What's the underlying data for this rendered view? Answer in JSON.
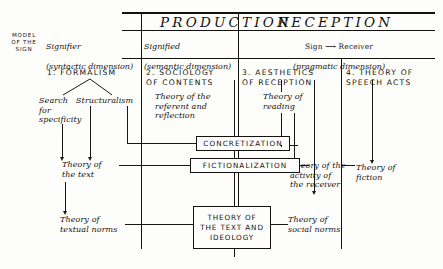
{
  "diagram": {
    "side_label": "MODEL\nOF THE\nSIGN",
    "banners": [
      {
        "id": "production",
        "label": "PRODUCTION"
      },
      {
        "id": "reception",
        "label": "RECEPTION"
      }
    ],
    "dimension_headers": [
      {
        "id": "signifier",
        "title": "Signifier",
        "sub": "(syntactic dimension)"
      },
      {
        "id": "signified",
        "title": "Signified",
        "sub": "(semantic dimension)"
      },
      {
        "id": "sign-receiver",
        "title": "Sign ⟶ Receiver",
        "sub": "(pragmatic dimension)"
      }
    ],
    "columns": [
      {
        "number": "1.",
        "title": "1. FORMALISM"
      },
      {
        "number": "2.",
        "title": "2. SOCIOLOGY\n     OF CONTENTS"
      },
      {
        "number": "3.",
        "title": "3. AESTHETICS\n    OF RECEPTION"
      },
      {
        "number": "4.",
        "title": "4. THEORY OF\n    SPEECH ACTS"
      }
    ],
    "nodes": [
      {
        "id": "search-for-specificity",
        "label": "Search\nfor\nspecificity"
      },
      {
        "id": "structuralism",
        "label": "Structuralism"
      },
      {
        "id": "theory-of-referent-and-reflection",
        "label": "Theory of the\nreferent and\nreflection"
      },
      {
        "id": "theory-of-reading",
        "label": "Theory of\nreading"
      },
      {
        "id": "theory-of-the-text",
        "label": "Theory of\nthe text"
      },
      {
        "id": "theory-of-activity-of-receiver",
        "label": "Theory of the\nactivity of\nthe receiver"
      },
      {
        "id": "theory-of-fiction",
        "label": "Theory of\nfiction"
      },
      {
        "id": "theory-of-textual-norms",
        "label": "Theory of\ntextual norms"
      },
      {
        "id": "theory-of-social-norms",
        "label": "Theory of\nsocial norms"
      }
    ],
    "boxes": [
      {
        "id": "concretization",
        "label": "CONCRETIZATION"
      },
      {
        "id": "fictionalization",
        "label": "FICTIONALIZATION"
      },
      {
        "id": "theory-of-the-text-and-ideology",
        "label": "THEORY OF\nTHE TEXT AND\nIDEOLOGY"
      }
    ],
    "colors": {
      "ink": "#14110f",
      "paper": "#fdfdfb"
    }
  }
}
